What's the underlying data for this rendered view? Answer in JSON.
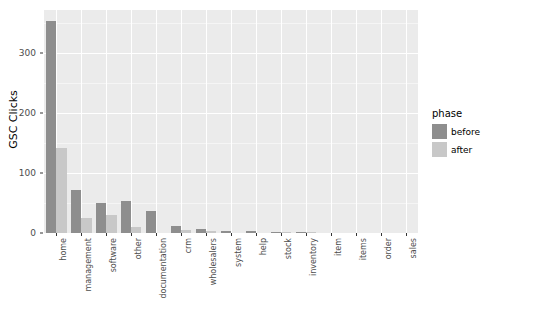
{
  "chart_data": {
    "type": "bar",
    "title": "",
    "xlabel": "",
    "ylabel": "GSC Clicks",
    "ylim": [
      0,
      372
    ],
    "yticks": [
      0,
      100,
      200,
      300
    ],
    "ytick_labels": [
      "0",
      "100",
      "200",
      "300"
    ],
    "grid": true,
    "legend_position": "right",
    "legend_title": "phase",
    "categories": [
      "home",
      "management",
      "software",
      "other",
      "documentation",
      "crm",
      "wholesalers",
      "system",
      "help",
      "stock",
      "inventory",
      "item",
      "items",
      "order",
      "sales"
    ],
    "series": [
      {
        "name": "before",
        "color": "#8e8e8e",
        "values": [
          353,
          72,
          50,
          54,
          36,
          11,
          7,
          3,
          3,
          2,
          2,
          0,
          0,
          0,
          0
        ]
      },
      {
        "name": "after",
        "color": "#c8c8c8",
        "values": [
          142,
          25,
          30,
          10,
          0,
          5,
          3,
          0,
          0,
          1,
          1,
          0,
          0,
          0,
          0
        ]
      }
    ]
  },
  "legend": {
    "title": "phase",
    "entries": [
      {
        "label": "before",
        "color": "#8e8e8e"
      },
      {
        "label": "after",
        "color": "#c8c8c8"
      }
    ]
  },
  "axes": {
    "y_title": "GSC Clicks"
  },
  "theme": {
    "panel_background": "#ebebeb",
    "grid_color": "#ffffff",
    "page_background": "#ffffff",
    "tick_label_color": "#4d4d4d"
  }
}
